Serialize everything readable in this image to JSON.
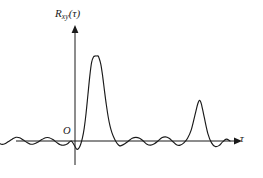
{
  "figure": {
    "name": "cross-correlation-function-plot",
    "background_color": "#ffffff",
    "line_color": "#1a1a1a"
  },
  "labels": {
    "y_axis_main": "R",
    "y_axis_subscript": "xy",
    "y_axis_argument": "(τ)",
    "origin": "O",
    "x_axis": "τ"
  },
  "chart_data": {
    "type": "line",
    "title": "",
    "subtitle": "",
    "xlabel": "τ",
    "ylabel": "R_xy(τ)",
    "legend": [],
    "legend_position": "none",
    "grid": false,
    "axis_style": "arrowed-axes",
    "xlim": [
      -100,
      170
    ],
    "ylim": [
      -12,
      100
    ],
    "x_ticks": [],
    "y_ticks": [],
    "annotations": [
      {
        "text": "O",
        "x": -6,
        "y": 6,
        "role": "origin-marker"
      }
    ],
    "features": {
      "primary_peak": {
        "x": 25,
        "y": 92,
        "width": 20
      },
      "secondary_peak": {
        "x": 135,
        "y": 44,
        "width": 11
      },
      "noise_amplitude": 5,
      "noise_cycles_left": 3,
      "noise_cycles_middle": 6,
      "undershoot_at_origin": -9
    },
    "series": [
      {
        "name": "R_xy",
        "x": [
          -100,
          -96,
          -92,
          -88,
          -84,
          -80,
          -76,
          -72,
          -68,
          -64,
          -60,
          -56,
          -52,
          -48,
          -44,
          -40,
          -36,
          -32,
          -28,
          -24,
          -20,
          -16,
          -12,
          -8,
          -4,
          0,
          2,
          4,
          6,
          8,
          10,
          12,
          14,
          16,
          18,
          20,
          22,
          24,
          25,
          26,
          28,
          30,
          32,
          34,
          36,
          38,
          40,
          42,
          44,
          46,
          48,
          50,
          54,
          58,
          62,
          66,
          70,
          74,
          78,
          82,
          86,
          90,
          94,
          98,
          102,
          106,
          110,
          114,
          118,
          122,
          126,
          130,
          133,
          135,
          137,
          140,
          144,
          148,
          152,
          156,
          160,
          164,
          168
        ],
        "y": [
          0,
          1.5,
          3,
          1.5,
          -1,
          -3.5,
          -3,
          -0.5,
          2,
          4,
          3.5,
          1,
          -1.5,
          -3.5,
          -3,
          -1,
          1.5,
          3.5,
          3.5,
          1.5,
          -1.5,
          -4,
          -4.5,
          -3,
          0,
          -6,
          -9,
          -8,
          -4,
          3,
          14,
          30,
          50,
          70,
          85,
          91,
          92,
          92,
          92,
          90,
          83,
          70,
          54,
          39,
          26,
          16,
          9,
          4,
          0,
          -3,
          -5,
          -5,
          -3,
          0,
          3,
          4,
          3,
          0,
          -3.5,
          -4.5,
          -3,
          0,
          3.5,
          4.5,
          3,
          -0.5,
          -4,
          -4.5,
          -2,
          3,
          12,
          28,
          40,
          44,
          40,
          26,
          8,
          -2,
          -6,
          -5,
          -1,
          2,
          0
        ]
      }
    ]
  }
}
